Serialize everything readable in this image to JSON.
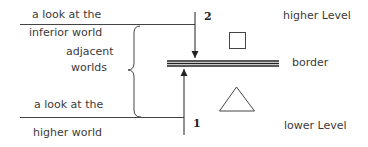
{
  "labels": {
    "look_inferior_top": "a look at the",
    "look_inferior_bottom": "inferior world",
    "adjacent_top": "adjacent",
    "adjacent_bottom": "worlds",
    "look_higher_top": "a look at the",
    "look_higher_bottom": "higher world",
    "higher_level": "higher Level",
    "border": "border",
    "lower_level": "lower Level",
    "arrow_down_number": "2",
    "arrow_up_number": "1"
  },
  "shapes": {
    "upper_symbol": "square",
    "lower_symbol": "triangle"
  },
  "colors": {
    "line": "#333333",
    "text": "#3a3a3a"
  }
}
